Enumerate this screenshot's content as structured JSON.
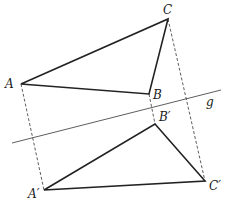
{
  "diagram": {
    "type": "reflection across line",
    "colors": {
      "stroke": "#222222",
      "background": "#ffffff"
    },
    "axis": {
      "label": "g",
      "x1": 12,
      "y1": 143,
      "x2": 221,
      "y2": 90
    },
    "points": {
      "A": {
        "label": "A",
        "x": 21,
        "y": 84
      },
      "B": {
        "label": "B",
        "x": 149,
        "y": 94
      },
      "C": {
        "label": "C",
        "x": 168,
        "y": 19
      },
      "A_prime": {
        "label": "A′",
        "x": 44,
        "y": 190
      },
      "B_prime": {
        "label": "B′",
        "x": 155,
        "y": 124
      },
      "C_prime": {
        "label": "C′",
        "x": 205,
        "y": 181
      }
    },
    "triangles": [
      {
        "name": "ABC",
        "vertices": [
          "A",
          "B",
          "C"
        ]
      },
      {
        "name": "A′B′C′",
        "vertices": [
          "A′",
          "B′",
          "C′"
        ]
      }
    ],
    "dashed_connectors": [
      "AA′",
      "BB′",
      "CC′"
    ]
  }
}
